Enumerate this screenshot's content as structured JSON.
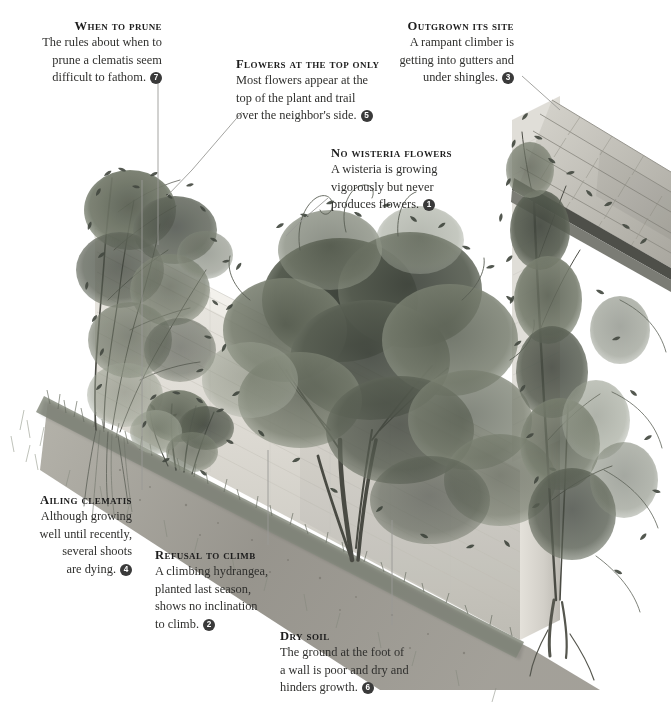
{
  "page": {
    "background_color": "#ffffff",
    "text_color": "#30302e",
    "badge_color": "#3a3a3a",
    "leader_line_color": "#8a8a8a",
    "width": 671,
    "height": 711
  },
  "illustration": {
    "name": "garden-wall-climbers-illustration",
    "description": "Pen-and-ink style illustration of a tall garden wall running in perspective from upper-left to lower-right, covered with climbing plants: a clematis at far left, a wisteria in the centre, a climbing hydrangea, and an ivy at right growing up onto a shingled roof. A grass and soil border runs along the foot of the wall.",
    "palette": {
      "wall_light": "#e8e6e0",
      "wall_mid": "#d4d2cb",
      "wall_shadow": "#b9b7b0",
      "foliage_dark": "#4a4f46",
      "foliage_mid": "#6e7467",
      "foliage_light": "#9aa092",
      "soil": "#8b8880",
      "grass": "#9fa396",
      "roof_tile": "#c9c7c0",
      "roof_tile_dark": "#a5a39c"
    }
  },
  "callouts": [
    {
      "id": "when-to-prune",
      "title": "When to prune",
      "body_lines": [
        "The rules about when to",
        "prune a clematis seem",
        "difficult to fathom."
      ],
      "badge": "7",
      "align": "right"
    },
    {
      "id": "flowers-at-the-top-only",
      "title": "Flowers at the top only",
      "body_lines": [
        "Most flowers appear at the",
        "top of the plant and trail",
        "over the neighbor's side."
      ],
      "badge": "5",
      "align": "left"
    },
    {
      "id": "no-wisteria-flowers",
      "title": "No wisteria flowers",
      "body_lines": [
        "A wisteria is growing",
        "vigorously but never",
        "produces flowers."
      ],
      "badge": "1",
      "align": "left"
    },
    {
      "id": "outgrown-its-site",
      "title": "Outgrown its site",
      "body_lines": [
        "A rampant climber is",
        "getting into gutters and",
        "under shingles."
      ],
      "badge": "3",
      "align": "right"
    },
    {
      "id": "ailing-clematis",
      "title": "Ailing clematis",
      "body_lines": [
        "Although growing",
        "well until recently,",
        "several shoots",
        "are dying."
      ],
      "badge": "4",
      "align": "right"
    },
    {
      "id": "refusal-to-climb",
      "title": "Refusal to climb",
      "body_lines": [
        "A climbing hydrangea,",
        "planted last season,",
        "shows no inclination",
        "to climb."
      ],
      "badge": "2",
      "align": "left"
    },
    {
      "id": "dry-soil",
      "title": "Dry soil",
      "body_lines": [
        "The ground at the foot of",
        "a wall is poor and dry and",
        "hinders growth."
      ],
      "badge": "6",
      "align": "left"
    }
  ]
}
